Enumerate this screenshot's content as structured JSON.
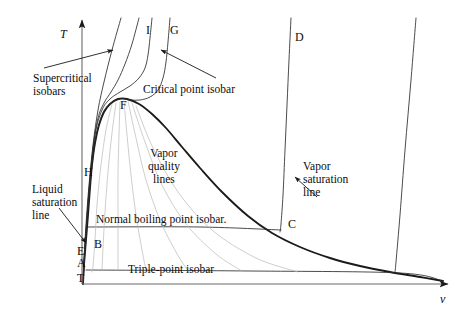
{
  "figure": {
    "type": "thermodynamic-phase-diagram",
    "title": "",
    "background_color": "#ffffff",
    "line_color": "#1a1a1a",
    "faint_line_color": "#b9b9b9",
    "text_color": "#0d0d0d"
  },
  "axes": {
    "y_label": "T",
    "x_label": "v",
    "y_label_meaning": "temperature",
    "x_label_meaning": "specific-volume",
    "origin_px": [
      82,
      284
    ],
    "y_top_px": [
      82,
      20
    ],
    "x_right_px": [
      448,
      284
    ]
  },
  "point_labels": [
    {
      "id": "I",
      "text": "I",
      "x": 146,
      "y": 24
    },
    {
      "id": "G",
      "text": "G",
      "x": 170,
      "y": 24
    },
    {
      "id": "D",
      "text": "D",
      "x": 295,
      "y": 31
    },
    {
      "id": "F",
      "text": "F",
      "x": 120,
      "y": 99
    },
    {
      "id": "H",
      "text": "H",
      "x": 84,
      "y": 166
    },
    {
      "id": "C",
      "text": "C",
      "x": 288,
      "y": 218
    },
    {
      "id": "B",
      "text": "B",
      "x": 94,
      "y": 238
    },
    {
      "id": "E",
      "text": "E",
      "x": 77,
      "y": 245
    },
    {
      "id": "A",
      "text": "A",
      "x": 77,
      "y": 257
    },
    {
      "id": "T",
      "text": "T",
      "x": 77,
      "y": 272
    }
  ],
  "annotations": [
    {
      "id": "supercritical-isobars",
      "lines": [
        "Supercritical",
        "isobars"
      ],
      "x": 33,
      "y": 72,
      "align": "left",
      "has_arrow": true
    },
    {
      "id": "critical-point-isobar",
      "lines": [
        "Critical point isobar"
      ],
      "x": 143,
      "y": 83,
      "align": "left",
      "has_arrow": true
    },
    {
      "id": "liquid-saturation-line",
      "lines": [
        "Liquid",
        "saturation",
        "line"
      ],
      "x": 32,
      "y": 183,
      "align": "left",
      "has_arrow": true
    },
    {
      "id": "vapor-quality-lines",
      "lines": [
        "Vapor",
        "quality",
        "lines"
      ],
      "x": 148,
      "y": 147,
      "align": "center",
      "has_arrow": false
    },
    {
      "id": "vapor-saturation-line",
      "lines": [
        "Vapor",
        "saturation",
        "line"
      ],
      "x": 303,
      "y": 160,
      "align": "left",
      "has_arrow": true
    },
    {
      "id": "normal-boiling-point-isobar",
      "lines": [
        "Normal boiling point isobar."
      ],
      "x": 96,
      "y": 213,
      "align": "left",
      "has_arrow": false
    },
    {
      "id": "triple-point-isobar",
      "lines": [
        "Triple-point isobar"
      ],
      "x": 128,
      "y": 263,
      "align": "left",
      "has_arrow": false
    }
  ],
  "chart_data": {
    "type": "line",
    "xlabel": "v",
    "ylabel": "T",
    "grid": false,
    "legend": "none",
    "series": [
      {
        "name": "saturation-dome",
        "role": "liquid and vapor saturation lines meeting at critical point F",
        "style": "solid-bold",
        "points": [
          [
            83,
            284
          ],
          [
            84,
            265
          ],
          [
            86,
            240
          ],
          [
            88,
            215
          ],
          [
            90,
            188
          ],
          [
            92,
            165
          ],
          [
            95,
            143
          ],
          [
            99,
            125
          ],
          [
            104,
            112
          ],
          [
            110,
            104
          ],
          [
            118,
            99
          ],
          [
            127,
            99
          ],
          [
            139,
            104
          ],
          [
            152,
            114
          ],
          [
            166,
            128
          ],
          [
            182,
            147
          ],
          [
            200,
            168
          ],
          [
            222,
            192
          ],
          [
            248,
            216
          ],
          [
            272,
            233
          ],
          [
            300,
            247
          ],
          [
            330,
            258
          ],
          [
            360,
            266
          ],
          [
            390,
            272
          ],
          [
            420,
            277
          ],
          [
            443,
            281
          ]
        ]
      },
      {
        "name": "supercritical-isobar-1",
        "role": "highest-pressure supercritical isobar (leftmost)",
        "style": "solid-thin",
        "points": [
          [
            121,
            18
          ],
          [
            112,
            50
          ],
          [
            104,
            82
          ],
          [
            98,
            110
          ],
          [
            93,
            145
          ],
          [
            89,
            185
          ],
          [
            86,
            225
          ],
          [
            84,
            260
          ],
          [
            83,
            284
          ]
        ]
      },
      {
        "name": "supercritical-isobar-2",
        "role": "second supercritical isobar",
        "style": "solid-thin",
        "points": [
          [
            139,
            18
          ],
          [
            132,
            44
          ],
          [
            125,
            64
          ],
          [
            118,
            80
          ],
          [
            111,
            92
          ],
          [
            104,
            103
          ],
          [
            98,
            118
          ],
          [
            93,
            148
          ],
          [
            89,
            190
          ],
          [
            86,
            232
          ],
          [
            84,
            265
          ],
          [
            83,
            284
          ]
        ]
      },
      {
        "name": "isobar-I",
        "role": "isobar labelled I, near-critical",
        "style": "solid-thin",
        "points": [
          [
            152,
            18
          ],
          [
            150,
            38
          ],
          [
            148,
            55
          ],
          [
            145,
            68
          ],
          [
            139,
            78
          ],
          [
            130,
            86
          ],
          [
            120,
            92
          ],
          [
            110,
            99
          ],
          [
            102,
            110
          ],
          [
            95,
            135
          ],
          [
            90,
            180
          ],
          [
            86,
            230
          ],
          [
            84,
            265
          ],
          [
            83,
            284
          ]
        ]
      },
      {
        "name": "isobar-G-critical",
        "role": "critical point isobar labelled G, passes through critical point F",
        "style": "solid-thin",
        "points": [
          [
            170,
            18
          ],
          [
            168,
            42
          ],
          [
            166,
            62
          ],
          [
            163,
            78
          ],
          [
            158,
            90
          ],
          [
            150,
            97
          ],
          [
            140,
            100
          ],
          [
            130,
            100
          ],
          [
            120,
            99
          ],
          [
            110,
            104
          ],
          [
            102,
            115
          ],
          [
            95,
            142
          ],
          [
            90,
            186
          ],
          [
            86,
            234
          ],
          [
            84,
            266
          ],
          [
            83,
            284
          ]
        ]
      },
      {
        "name": "isobar-D",
        "role": "isobar labelled D, subcritical, crosses dome at C",
        "style": "solid-thin",
        "points": [
          [
            291,
            18
          ],
          [
            289,
            60
          ],
          [
            287,
            105
          ],
          [
            285,
            150
          ],
          [
            283,
            195
          ],
          [
            281,
            224
          ],
          [
            280,
            232
          ]
        ]
      },
      {
        "name": "normal-boiling-point-isobar-line",
        "role": "horizontal constant-pressure line at normal boiling point, from B to C",
        "style": "solid-thin",
        "points": [
          [
            88,
            227
          ],
          [
            200,
            227
          ],
          [
            281,
            230
          ]
        ]
      },
      {
        "name": "triple-point-isobar-line",
        "role": "horizontal constant-pressure line at the triple point",
        "style": "solid-thin",
        "points": [
          [
            86,
            270
          ],
          [
            250,
            271
          ],
          [
            400,
            273
          ],
          [
            443,
            281
          ]
        ]
      },
      {
        "name": "far-right-isobar",
        "role": "lowest-pressure isobar at far right, descends to triple-point line",
        "style": "solid-thin",
        "points": [
          [
            416,
            18
          ],
          [
            411,
            80
          ],
          [
            405,
            150
          ],
          [
            400,
            215
          ],
          [
            396,
            262
          ],
          [
            395,
            272
          ]
        ]
      },
      {
        "name": "vapor-quality-line-1",
        "role": "constant quality line inside dome",
        "style": "faint",
        "points": [
          [
            112,
            104
          ],
          [
            106,
            130
          ],
          [
            101,
            165
          ],
          [
            97,
            205
          ],
          [
            95,
            240
          ],
          [
            93,
            266
          ],
          [
            92,
            272
          ]
        ]
      },
      {
        "name": "vapor-quality-line-2",
        "role": "constant quality line inside dome",
        "style": "faint",
        "points": [
          [
            116,
            103
          ],
          [
            112,
            133
          ],
          [
            108,
            172
          ],
          [
            105,
            212
          ],
          [
            103,
            248
          ],
          [
            102,
            270
          ]
        ]
      },
      {
        "name": "vapor-quality-line-3",
        "role": "constant quality line inside dome",
        "style": "faint",
        "points": [
          [
            120,
            102
          ],
          [
            119,
            135
          ],
          [
            118,
            175
          ],
          [
            118,
            215
          ],
          [
            118,
            250
          ],
          [
            118,
            270
          ]
        ]
      },
      {
        "name": "vapor-quality-line-4",
        "role": "constant quality line inside dome",
        "style": "faint",
        "points": [
          [
            124,
            101
          ],
          [
            127,
            135
          ],
          [
            131,
            175
          ],
          [
            136,
            215
          ],
          [
            142,
            250
          ],
          [
            146,
            270
          ]
        ]
      },
      {
        "name": "vapor-quality-line-5",
        "role": "constant quality line inside dome",
        "style": "faint",
        "points": [
          [
            128,
            101
          ],
          [
            136,
            138
          ],
          [
            146,
            180
          ],
          [
            160,
            220
          ],
          [
            176,
            252
          ],
          [
            188,
            271
          ]
        ]
      },
      {
        "name": "vapor-quality-line-6",
        "role": "constant quality line inside dome",
        "style": "faint",
        "points": [
          [
            132,
            103
          ],
          [
            145,
            142
          ],
          [
            162,
            185
          ],
          [
            186,
            224
          ],
          [
            216,
            254
          ],
          [
            242,
            271
          ]
        ]
      },
      {
        "name": "vapor-quality-line-7",
        "role": "constant quality line inside dome",
        "style": "faint",
        "points": [
          [
            136,
            106
          ],
          [
            153,
            148
          ],
          [
            178,
            192
          ],
          [
            212,
            230
          ],
          [
            256,
            258
          ],
          [
            298,
            272
          ]
        ]
      }
    ],
    "arrows": [
      {
        "id": "arrow-supercritical-isobars",
        "from": [
          44,
          68
        ],
        "to": [
          113,
          50
        ]
      },
      {
        "id": "arrow-critical-point-isobar",
        "from": [
          216,
          78
        ],
        "to": [
          161,
          50
        ]
      },
      {
        "id": "arrow-liquid-saturation-line",
        "from": [
          59,
          208
        ],
        "to": [
          86,
          243
        ]
      },
      {
        "id": "arrow-vapor-saturation-line",
        "from": [
          317,
          197
        ],
        "to": [
          295,
          177
        ]
      }
    ]
  }
}
